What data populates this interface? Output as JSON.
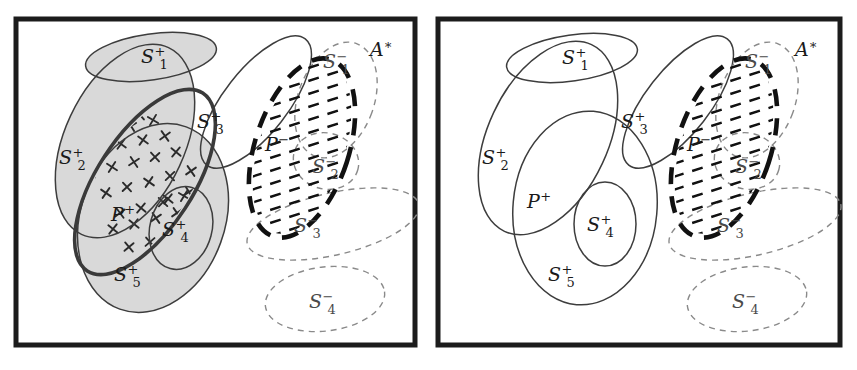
{
  "figure": {
    "background_color": "#ffffff",
    "panel_border_color": "#1c1c1c",
    "panel_count": 2
  },
  "style": {
    "solid_stroke": "#3d3d3d",
    "thick_stroke": "#3a3a3a",
    "dashed_light_stroke": "#8a8a8a",
    "dashed_thick_stroke": "#111111",
    "shade_fill": "#d9d9d9",
    "marker_color": "#2b2b2b",
    "marker_glyph": "x-marker"
  },
  "panels": [
    {
      "id": "left",
      "name": "panel-left",
      "universe_label": "ᴀ*",
      "universe_label_text": "A*",
      "has_shading": true,
      "has_markers": true,
      "positive_sets": [
        {
          "id": "S1p",
          "base": "S",
          "sup": "+",
          "sub": "1",
          "label": "S1+",
          "cx": 138,
          "cy": 41,
          "rx": 66,
          "ry": 23,
          "rot": -8,
          "lx": 128,
          "ly": 47
        },
        {
          "id": "S2p",
          "base": "S",
          "sup": "+",
          "sub": "2",
          "label": "S2+",
          "cx": 112,
          "cy": 125,
          "rx": 60,
          "ry": 103,
          "rot": 25,
          "lx": 46,
          "ly": 148
        },
        {
          "id": "S3p",
          "base": "S",
          "sup": "+",
          "sub": "3",
          "label": "S3+",
          "cx": 243,
          "cy": 86,
          "rx": 32,
          "ry": 80,
          "rot": 38,
          "lx": 184,
          "ly": 112
        },
        {
          "id": "S4p",
          "base": "S",
          "sup": "+",
          "sub": "4",
          "label": "S4+",
          "cx": 168,
          "cy": 212,
          "rx": 31,
          "ry": 42,
          "rot": 15,
          "lx": 149,
          "ly": 220
        },
        {
          "id": "S5p",
          "base": "S",
          "sup": "+",
          "sub": "5",
          "label": "S5+",
          "cx": 140,
          "cy": 202,
          "rx": 72,
          "ry": 97,
          "rot": 20,
          "lx": 101,
          "ly": 265
        }
      ],
      "positive_region": {
        "id": "Pp",
        "base": "P",
        "sup": "+",
        "label": "P+",
        "cx": 132,
        "cy": 166,
        "rx": 48,
        "ry": 106,
        "rot": 33,
        "lx": 98,
        "ly": 205
      },
      "negative_sets": [
        {
          "id": "S1n",
          "base": "S",
          "sup": "−",
          "sub": "1",
          "label": "S1-",
          "cx": 323,
          "cy": 84,
          "rx": 38,
          "ry": 60,
          "rot": 20,
          "lx": 310,
          "ly": 52
        },
        {
          "id": "S2n",
          "base": "S",
          "sup": "−",
          "sub": "2",
          "label": "S2-",
          "cx": 313,
          "cy": 145,
          "rx": 33,
          "ry": 28,
          "rot": 15,
          "lx": 299,
          "ly": 157
        },
        {
          "id": "S3n",
          "base": "S",
          "sup": "−",
          "sub": "3",
          "label": "S3-",
          "cx": 320,
          "cy": 208,
          "rx": 88,
          "ry": 31,
          "rot": -13,
          "lx": 281,
          "ly": 216
        },
        {
          "id": "S4n",
          "base": "S",
          "sup": "−",
          "sub": "4",
          "label": "S4-",
          "cx": 312,
          "cy": 283,
          "rx": 60,
          "ry": 32,
          "rot": -7,
          "lx": 296,
          "ly": 292
        }
      ],
      "negative_region": {
        "id": "Pn",
        "base": "P",
        "sup": "−",
        "label": "P-",
        "cx": 289,
        "cy": 132,
        "rx": 47,
        "ry": 93,
        "rot": 18,
        "lx": 252,
        "ly": 135
      }
    },
    {
      "id": "right",
      "name": "panel-right",
      "universe_label": "ᴀ*",
      "universe_label_text": "A*",
      "has_shading": false,
      "has_markers": false,
      "positive_sets": [
        {
          "id": "S1p",
          "base": "S",
          "sup": "+",
          "sub": "1",
          "label": "S1+",
          "cx": 137,
          "cy": 42,
          "rx": 66,
          "ry": 23,
          "rot": -8,
          "lx": 127,
          "ly": 48
        },
        {
          "id": "S2p",
          "base": "S",
          "sup": "+",
          "sub": "2",
          "label": "S2+",
          "cx": 113,
          "cy": 122,
          "rx": 60,
          "ry": 103,
          "rot": 25,
          "lx": 47,
          "ly": 148
        },
        {
          "id": "S3p",
          "base": "S",
          "sup": "+",
          "sub": "3",
          "label": "S3+",
          "cx": 243,
          "cy": 86,
          "rx": 32,
          "ry": 80,
          "rot": 38,
          "lx": 186,
          "ly": 112
        },
        {
          "id": "S4p",
          "base": "S",
          "sup": "+",
          "sub": "4",
          "label": "S4+",
          "cx": 170,
          "cy": 208,
          "rx": 31,
          "ry": 42,
          "rot": 0,
          "lx": 152,
          "ly": 215
        },
        {
          "id": "S5p",
          "base": "S",
          "sup": "+",
          "sub": "5",
          "label": "S5+",
          "cx": 150,
          "cy": 192,
          "rx": 72,
          "ry": 97,
          "rot": 5,
          "lx": 113,
          "ly": 265
        }
      ],
      "positive_region": {
        "id": "Pp",
        "base": "P",
        "sup": "+",
        "label": "P+",
        "cx": 150,
        "cy": 192,
        "rx": 72,
        "ry": 97,
        "rot": 5,
        "lx": 92,
        "ly": 192
      },
      "negative_sets": [
        {
          "id": "S1n",
          "base": "S",
          "sup": "−",
          "sub": "1",
          "label": "S1-",
          "cx": 322,
          "cy": 84,
          "rx": 38,
          "ry": 60,
          "rot": 20,
          "lx": 310,
          "ly": 52
        },
        {
          "id": "S2n",
          "base": "S",
          "sup": "−",
          "sub": "2",
          "label": "S2-",
          "cx": 312,
          "cy": 145,
          "rx": 33,
          "ry": 28,
          "rot": 15,
          "lx": 300,
          "ly": 157
        },
        {
          "id": "S3n",
          "base": "S",
          "sup": "−",
          "sub": "3",
          "label": "S3-",
          "cx": 320,
          "cy": 208,
          "rx": 88,
          "ry": 31,
          "rot": -13,
          "lx": 282,
          "ly": 216
        },
        {
          "id": "S4n",
          "base": "S",
          "sup": "−",
          "sub": "4",
          "label": "S4-",
          "cx": 312,
          "cy": 283,
          "rx": 60,
          "ry": 32,
          "rot": -7,
          "lx": 297,
          "ly": 292
        }
      ],
      "negative_region": {
        "id": "Pn",
        "base": "P",
        "sup": "−",
        "label": "P-",
        "cx": 289,
        "cy": 132,
        "rx": 47,
        "ry": 93,
        "rot": 18,
        "lx": 252,
        "ly": 135
      }
    }
  ],
  "markers": [
    [
      84,
      96
    ],
    [
      106,
      86
    ],
    [
      127,
      99
    ],
    [
      70,
      117
    ],
    [
      95,
      112
    ],
    [
      118,
      110
    ],
    [
      140,
      104
    ],
    [
      62,
      139
    ],
    [
      86,
      133
    ],
    [
      108,
      128
    ],
    [
      130,
      124
    ],
    [
      152,
      120
    ],
    [
      78,
      157
    ],
    [
      99,
      151
    ],
    [
      121,
      146
    ],
    [
      142,
      141
    ],
    [
      163,
      136
    ],
    [
      93,
      177
    ],
    [
      114,
      171
    ],
    [
      136,
      166
    ],
    [
      157,
      160
    ],
    [
      178,
      155
    ],
    [
      107,
      197
    ],
    [
      128,
      192
    ],
    [
      150,
      186
    ],
    [
      171,
      180
    ],
    [
      100,
      213
    ],
    [
      121,
      208
    ],
    [
      143,
      202
    ],
    [
      164,
      197
    ],
    [
      185,
      191
    ],
    [
      116,
      231
    ],
    [
      137,
      226
    ],
    [
      158,
      220
    ],
    [
      180,
      214
    ],
    [
      131,
      247
    ],
    [
      152,
      242
    ],
    [
      174,
      236
    ],
    [
      146,
      262
    ],
    [
      168,
      257
    ],
    [
      189,
      250
    ],
    [
      163,
      272
    ],
    [
      184,
      266
    ],
    [
      155,
      183
    ],
    [
      176,
      176
    ],
    [
      196,
      212
    ],
    [
      190,
      232
    ],
    [
      200,
      195
    ],
    [
      175,
      247
    ],
    [
      196,
      240
    ]
  ]
}
